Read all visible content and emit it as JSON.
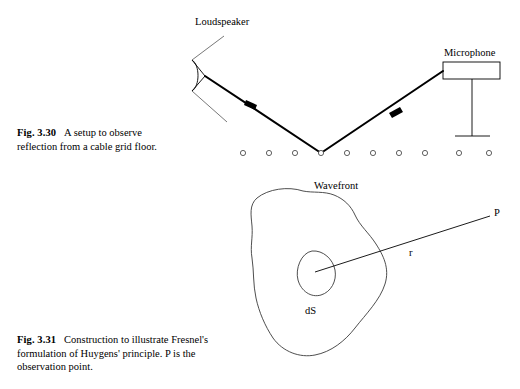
{
  "page": {
    "background_color": "#ffffff",
    "ink_color": "#000000",
    "width": 520,
    "height": 389
  },
  "figures": [
    {
      "id": "fig-3-30",
      "number": "Fig. 3.30",
      "caption_lines": [
        "A setup to observe",
        "reflection from a cable grid floor."
      ],
      "caption_full": "A setup to observe reflection from a cable grid floor.",
      "labels": {
        "loudspeaker": "Loudspeaker",
        "microphone": "Microphone"
      },
      "grid_floor": {
        "circle_count": 10,
        "circle_radius": 2.6,
        "first_circle_x": 243,
        "spacing_x": 26,
        "baseline_y": 153,
        "reflection_circle_index": 3
      },
      "rays": {
        "incident_from": [
          205,
          76
        ],
        "reflection_point": [
          321,
          153
        ],
        "reflected_to": [
          443,
          71
        ],
        "incident_arrow_at": [
          251,
          107
        ],
        "reflected_arrow_at": [
          394,
          112
        ]
      },
      "microphone_body": {
        "x": 443,
        "y": 62,
        "width": 57,
        "height": 17,
        "stand_x": 472,
        "stand_bottom_y": 136,
        "base_x1": 455,
        "base_x2": 490
      }
    },
    {
      "id": "fig-3-31",
      "number": "Fig. 3.31",
      "caption_lines": [
        "Construction to illustrate Fresnel's",
        "formulation of Huygens' principle. P is the",
        "observation point."
      ],
      "caption_full": "Construction to illustrate Fresnel's formulation of Huygens' principle. P is the observation point.",
      "labels": {
        "wavefront": "Wavefront",
        "element": "dS",
        "radius": "r",
        "point": "P"
      },
      "geometry": {
        "dS_center": [
          315,
          272
        ],
        "P_point": [
          490,
          216
        ],
        "r_label_at": [
          412,
          252
        ]
      }
    }
  ]
}
